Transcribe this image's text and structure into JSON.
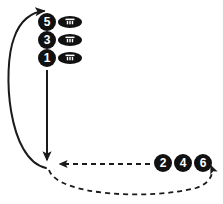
{
  "diagram": {
    "background_color": "#ffffff",
    "stroke_color": "#1a1a1a",
    "marker_fill": "#111111",
    "marker_text_color": "#ffffff",
    "ball_color": "#111111",
    "ball_lace_color": "#ffffff"
  },
  "left_column": {
    "markers": [
      {
        "label": "5",
        "cx": 47,
        "cy": 22,
        "r": 9
      },
      {
        "label": "3",
        "cx": 47,
        "cy": 40,
        "r": 9
      },
      {
        "label": "1",
        "cx": 47,
        "cy": 58,
        "r": 9
      }
    ],
    "balls": [
      {
        "cx": 70,
        "cy": 22,
        "rx": 12,
        "ry": 6
      },
      {
        "cx": 70,
        "cy": 40,
        "rx": 12,
        "ry": 6
      },
      {
        "cx": 70,
        "cy": 58,
        "rx": 12,
        "ry": 6
      }
    ]
  },
  "right_group": {
    "markers": [
      {
        "label": "2",
        "cx": 163,
        "cy": 163,
        "r": 9
      },
      {
        "label": "4",
        "cx": 183,
        "cy": 163,
        "r": 9
      },
      {
        "label": "6",
        "cx": 203,
        "cy": 163,
        "r": 9
      }
    ]
  },
  "paths": {
    "solid_down_arrow": {
      "name": "vertical-down-arrow",
      "style": "solid",
      "d": "M 47 70 L 47 164"
    },
    "solid_return_curve": {
      "name": "left-return-curve-arrow",
      "style": "solid",
      "d": "M 46 168 C 8 160 2 70 14 38 C 20 20 32 12 44 11"
    },
    "dashed_horizontal_arrow": {
      "name": "dashed-horizontal-arrow",
      "style": "dashed",
      "d": "M 150 164 L 56 164"
    },
    "dashed_loop_curve": {
      "name": "dashed-loop-curve-arrow",
      "style": "dashed",
      "d": "M 49 170 C 58 196 150 200 196 188 C 212 183 214 172 210 164"
    }
  }
}
